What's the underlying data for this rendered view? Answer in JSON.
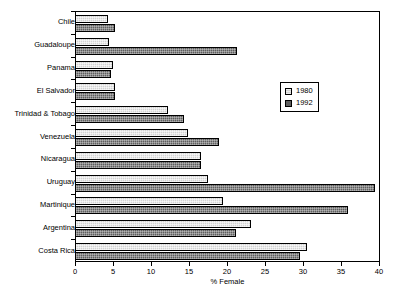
{
  "chart_data": {
    "type": "bar",
    "orientation": "horizontal",
    "title": "",
    "xlabel": "% Female",
    "ylabel": "",
    "xlim": [
      0,
      40
    ],
    "xticks": [
      0,
      5,
      10,
      15,
      20,
      25,
      30,
      35,
      40
    ],
    "grid": false,
    "legend_position": "upper-right-inset",
    "categories": [
      "Chile",
      "Guadaloupe",
      "Panama",
      "El Salvador",
      "Trinidad & Tobago",
      "Venezuela",
      "Nicaragua",
      "Uruguay",
      "Martinique",
      "Argentina",
      "Costa Rica"
    ],
    "series": [
      {
        "name": "1980",
        "color": "#d2d2d2",
        "values": [
          4.2,
          4.3,
          4.9,
          5.1,
          12.1,
          14.8,
          16.4,
          17.4,
          19.3,
          23.0,
          30.4
        ]
      },
      {
        "name": "1992",
        "color": "#5e5e5e",
        "values": [
          5.1,
          21.2,
          4.6,
          5.1,
          14.2,
          18.8,
          16.4,
          39.3,
          35.8,
          21.0,
          29.5
        ]
      }
    ]
  },
  "legend": {
    "entries": [
      {
        "label": "1980"
      },
      {
        "label": "1992"
      }
    ]
  }
}
